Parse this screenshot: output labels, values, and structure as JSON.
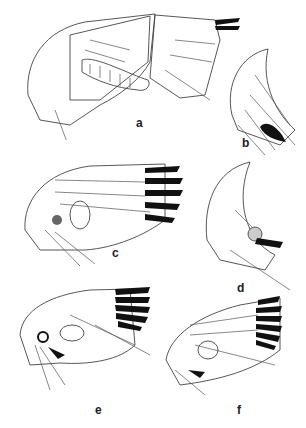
{
  "figure": {
    "type": "scientific illustration plate",
    "panels": [
      {
        "id": "a",
        "label": "a"
      },
      {
        "id": "b",
        "label": "b"
      },
      {
        "id": "c",
        "label": "c"
      },
      {
        "id": "d",
        "label": "d"
      },
      {
        "id": "e",
        "label": "e"
      },
      {
        "id": "f",
        "label": "f"
      }
    ]
  }
}
